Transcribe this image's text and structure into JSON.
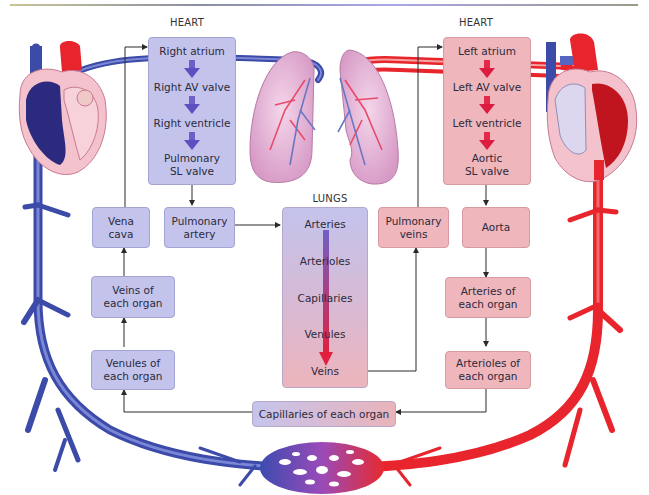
{
  "diagram": {
    "type": "circulatory-system-flowchart",
    "colors": {
      "deoxygenated_blue": "#3c4aa8",
      "oxygenated_red": "#e8242c",
      "blue_box": "#c3c3ec",
      "pink_box": "#efb6bc",
      "arrow_line": "#2a2a2a"
    }
  },
  "labels": {
    "heart_right": "HEART",
    "heart_left": "HEART",
    "lungs": "LUNGS"
  },
  "right_heart": {
    "steps": [
      "Right atrium",
      "Right AV valve",
      "Right ventricle",
      "Pulmonary",
      "SL valve"
    ]
  },
  "left_heart": {
    "steps": [
      "Left atrium",
      "Left AV valve",
      "Left ventricle",
      "Aortic",
      "SL valve"
    ]
  },
  "lungs": {
    "items": [
      "Arteries",
      "Arterioles",
      "Capillaries",
      "Venules",
      "Veins"
    ]
  },
  "boxes": {
    "vena_cava": [
      "Vena",
      "cava"
    ],
    "pulmonary_artery": [
      "Pulmonary",
      "artery"
    ],
    "pulmonary_veins": [
      "Pulmonary",
      "veins"
    ],
    "aorta": [
      "Aorta"
    ],
    "veins_of_organ": [
      "Veins of",
      "each organ"
    ],
    "venules_of_organ": [
      "Venules of",
      "each organ"
    ],
    "arteries_of_organ": [
      "Arteries of",
      "each organ"
    ],
    "arterioles_of_organ": [
      "Arterioles of",
      "each organ"
    ],
    "capillaries_of_organ": "Capillaries of each organ"
  },
  "icons": {
    "left_heart_illustration": "heart-anatomy-icon",
    "right_heart_illustration": "heart-anatomy-icon",
    "lungs_illustration": "lungs-icon",
    "capillary_bed": "capillary-network-icon"
  }
}
